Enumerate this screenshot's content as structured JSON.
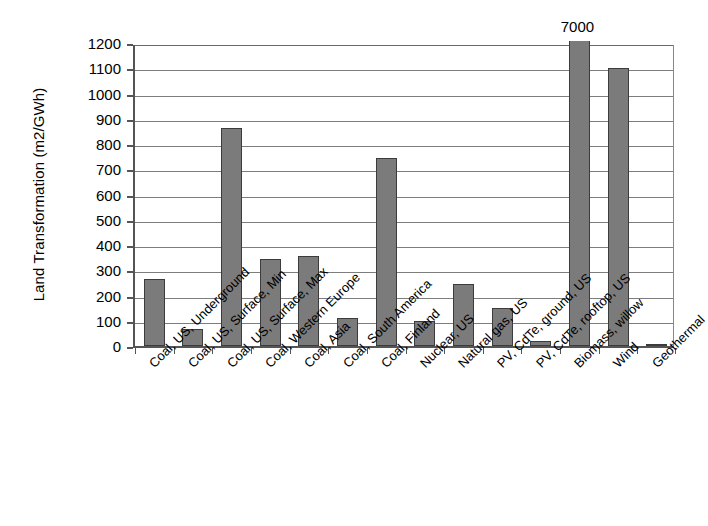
{
  "chart_data": {
    "type": "bar",
    "title": "",
    "xlabel": "",
    "ylabel": "Land Transformation (m2/GWh)",
    "ylim": [
      0,
      1200
    ],
    "ytick_step": 100,
    "yticks": [
      "1200",
      "1100",
      "1000",
      "900",
      "800",
      "700",
      "600",
      "500",
      "400",
      "300",
      "200",
      "100",
      "0"
    ],
    "grid": true,
    "legend": "none",
    "bar_color": "#7b7b7b",
    "bar_edge_color": "#3c3c3c",
    "axis_color": "#555555",
    "categories": [
      "Coal, US, Underground",
      "Coal, US, Surface, Min",
      "Coal, US, Surface, Max",
      "Coal, Western Europe",
      "Coal, Asia",
      "Coal, South America",
      "Coal, Finland",
      "Nuclear, US",
      "Natural gas, US",
      "PV, CdTe, ground, US",
      "PV, CdTe, rooftop, US",
      "Biomass, willow",
      "Wind",
      "Geothermal"
    ],
    "values": [
      265,
      68,
      862,
      345,
      355,
      110,
      745,
      98,
      245,
      150,
      20,
      7000,
      1100,
      8
    ],
    "annotations": [
      {
        "category": "Biomass, willow",
        "text": "7000",
        "note": "bar clipped at axis maximum; true value annotated above plot"
      }
    ]
  }
}
